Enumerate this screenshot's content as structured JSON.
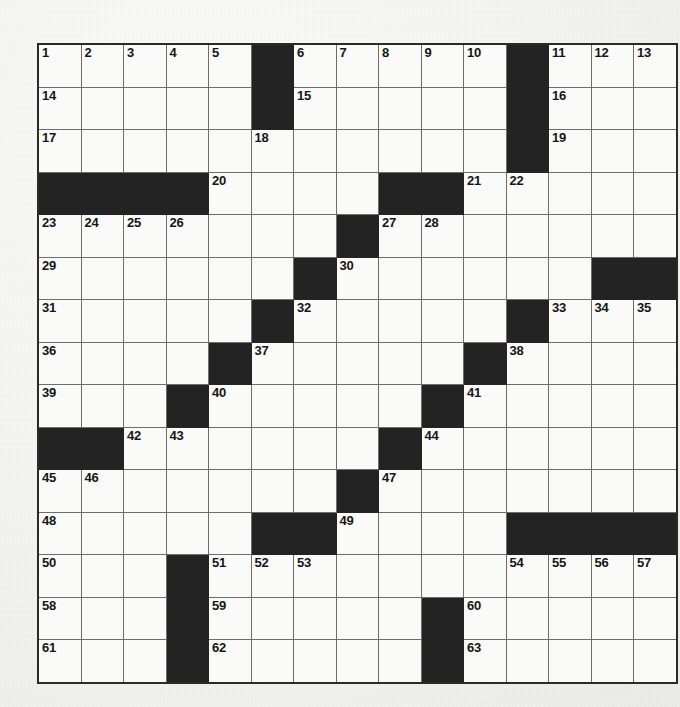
{
  "puzzle": {
    "title": "Crossword Puzzle Grid",
    "rows": 15,
    "cols": 15,
    "cell_size_px": 41.5,
    "colors": {
      "paper": "#f2f2ef",
      "cell_fill": "#fafaf8",
      "block_fill": "#232323",
      "grid_line": "#6d6d6d",
      "border": "#2a2a2a",
      "number_text": "#161616"
    },
    "max_clue_number": 63,
    "black_squares": [
      [
        0,
        5
      ],
      [
        0,
        11
      ],
      [
        1,
        5
      ],
      [
        1,
        11
      ],
      [
        2,
        11
      ],
      [
        3,
        0
      ],
      [
        3,
        1
      ],
      [
        3,
        2
      ],
      [
        3,
        3
      ],
      [
        3,
        8
      ],
      [
        3,
        9
      ],
      [
        4,
        7
      ],
      [
        5,
        6
      ],
      [
        5,
        13
      ],
      [
        5,
        14
      ],
      [
        6,
        5
      ],
      [
        6,
        11
      ],
      [
        7,
        4
      ],
      [
        7,
        10
      ],
      [
        8,
        3
      ],
      [
        8,
        9
      ],
      [
        9,
        0
      ],
      [
        9,
        1
      ],
      [
        9,
        8
      ],
      [
        10,
        7
      ],
      [
        11,
        5
      ],
      [
        11,
        6
      ],
      [
        11,
        11
      ],
      [
        11,
        12
      ],
      [
        11,
        13
      ],
      [
        11,
        14
      ],
      [
        12,
        3
      ],
      [
        13,
        3
      ],
      [
        13,
        9
      ],
      [
        14,
        3
      ],
      [
        14,
        9
      ]
    ],
    "numbered_cells": [
      {
        "n": 1,
        "row": 0,
        "col": 0
      },
      {
        "n": 2,
        "row": 0,
        "col": 1
      },
      {
        "n": 3,
        "row": 0,
        "col": 2
      },
      {
        "n": 4,
        "row": 0,
        "col": 3
      },
      {
        "n": 5,
        "row": 0,
        "col": 4
      },
      {
        "n": 6,
        "row": 0,
        "col": 6
      },
      {
        "n": 7,
        "row": 0,
        "col": 7
      },
      {
        "n": 8,
        "row": 0,
        "col": 8
      },
      {
        "n": 9,
        "row": 0,
        "col": 9
      },
      {
        "n": 10,
        "row": 0,
        "col": 10
      },
      {
        "n": 11,
        "row": 0,
        "col": 12
      },
      {
        "n": 12,
        "row": 0,
        "col": 13
      },
      {
        "n": 13,
        "row": 0,
        "col": 14
      },
      {
        "n": 14,
        "row": 1,
        "col": 0
      },
      {
        "n": 15,
        "row": 1,
        "col": 6
      },
      {
        "n": 16,
        "row": 1,
        "col": 12
      },
      {
        "n": 17,
        "row": 2,
        "col": 0
      },
      {
        "n": 18,
        "row": 2,
        "col": 5
      },
      {
        "n": 19,
        "row": 2,
        "col": 12
      },
      {
        "n": 20,
        "row": 3,
        "col": 4
      },
      {
        "n": 21,
        "row": 3,
        "col": 10
      },
      {
        "n": 22,
        "row": 3,
        "col": 11
      },
      {
        "n": 23,
        "row": 4,
        "col": 0
      },
      {
        "n": 24,
        "row": 4,
        "col": 1
      },
      {
        "n": 25,
        "row": 4,
        "col": 2
      },
      {
        "n": 26,
        "row": 4,
        "col": 3
      },
      {
        "n": 27,
        "row": 4,
        "col": 8
      },
      {
        "n": 28,
        "row": 4,
        "col": 9
      },
      {
        "n": 29,
        "row": 5,
        "col": 0
      },
      {
        "n": 30,
        "row": 5,
        "col": 7
      },
      {
        "n": 31,
        "row": 6,
        "col": 0
      },
      {
        "n": 32,
        "row": 6,
        "col": 6
      },
      {
        "n": 33,
        "row": 6,
        "col": 12
      },
      {
        "n": 34,
        "row": 6,
        "col": 13
      },
      {
        "n": 35,
        "row": 6,
        "col": 14
      },
      {
        "n": 36,
        "row": 7,
        "col": 0
      },
      {
        "n": 37,
        "row": 7,
        "col": 5
      },
      {
        "n": 38,
        "row": 7,
        "col": 11
      },
      {
        "n": 39,
        "row": 8,
        "col": 0
      },
      {
        "n": 40,
        "row": 8,
        "col": 4
      },
      {
        "n": 41,
        "row": 8,
        "col": 10
      },
      {
        "n": 42,
        "row": 9,
        "col": 2
      },
      {
        "n": 43,
        "row": 9,
        "col": 3
      },
      {
        "n": 44,
        "row": 9,
        "col": 9
      },
      {
        "n": 45,
        "row": 10,
        "col": 0
      },
      {
        "n": 46,
        "row": 10,
        "col": 1
      },
      {
        "n": 47,
        "row": 10,
        "col": 8
      },
      {
        "n": 48,
        "row": 11,
        "col": 0
      },
      {
        "n": 49,
        "row": 11,
        "col": 7
      },
      {
        "n": 50,
        "row": 12,
        "col": 0
      },
      {
        "n": 51,
        "row": 12,
        "col": 4
      },
      {
        "n": 52,
        "row": 12,
        "col": 5
      },
      {
        "n": 53,
        "row": 12,
        "col": 6
      },
      {
        "n": 54,
        "row": 12,
        "col": 11
      },
      {
        "n": 55,
        "row": 12,
        "col": 12
      },
      {
        "n": 56,
        "row": 12,
        "col": 13
      },
      {
        "n": 57,
        "row": 12,
        "col": 14
      },
      {
        "n": 58,
        "row": 13,
        "col": 0
      },
      {
        "n": 59,
        "row": 13,
        "col": 4
      },
      {
        "n": 60,
        "row": 13,
        "col": 10
      },
      {
        "n": 61,
        "row": 14,
        "col": 0
      },
      {
        "n": 62,
        "row": 14,
        "col": 4
      },
      {
        "n": 63,
        "row": 14,
        "col": 10
      }
    ]
  }
}
